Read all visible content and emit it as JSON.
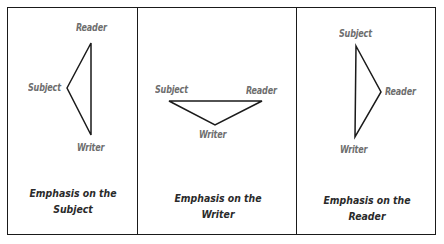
{
  "panels": [
    {
      "caption_line1": "Emphasis on the",
      "caption_line2": "Subject",
      "labels": {
        "subject": "Subject",
        "reader": "Reader",
        "writer": "Writer"
      }
    },
    {
      "caption_line1": "Emphasis on the",
      "caption_line2": "Writer",
      "labels": {
        "subject": "Subject",
        "reader": "Reader",
        "writer": "Writer"
      }
    },
    {
      "caption_line1": "Emphasis on the",
      "caption_line2": "Reader",
      "labels": {
        "subject": "Subject",
        "reader": "Reader",
        "writer": "Writer"
      }
    }
  ],
  "colors": {
    "line": "#1a1a1a",
    "label": "#6e6e6e",
    "caption": "#2a2a2a"
  }
}
